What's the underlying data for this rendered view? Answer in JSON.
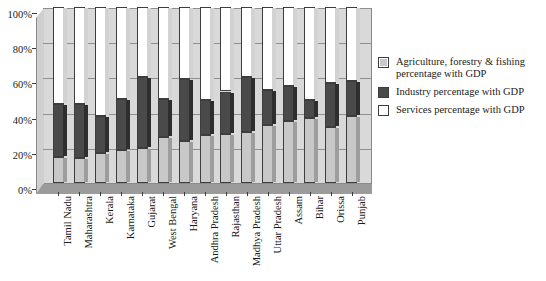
{
  "chart_data": {
    "type": "bar",
    "stacked": true,
    "orientation": "vertical",
    "title": "",
    "xlabel": "",
    "ylabel": "",
    "ylim": [
      0,
      100
    ],
    "yunit": "%",
    "grid": true,
    "legend_position": "right",
    "ytick_labels": [
      "100%",
      "80%",
      "60%",
      "40%",
      "20%",
      "0%"
    ],
    "ytick_values": [
      100,
      80,
      60,
      40,
      20,
      0
    ],
    "categories": [
      "Tamil Nadu",
      "Maharashtra",
      "Kerala",
      "Karnataka",
      "Gujarat",
      "West Bengal",
      "Haryana",
      "Andhra Pradesh",
      "Rajasthan",
      "Madhya Pradesh",
      "Uttar Pradesh",
      "Assam",
      "Bihar",
      "Orissa",
      "Punjab"
    ],
    "series": [
      {
        "name": "Agriculture, forestry & fishing percentage with GDP",
        "color": "#c8c8c8",
        "values": [
          15,
          14,
          17,
          19,
          20,
          26,
          24,
          27,
          28,
          29,
          33,
          35,
          37,
          32,
          38
        ]
      },
      {
        "name": "Industry percentage with GDP",
        "color": "#4a4a4a",
        "values": [
          30,
          31,
          21,
          29,
          40,
          22,
          35,
          20,
          24,
          31,
          20,
          20,
          10,
          25,
          20
        ]
      },
      {
        "name": "Services percentage with GDP",
        "color": "#ffffff",
        "values": [
          55,
          55,
          62,
          52,
          40,
          52,
          41,
          53,
          48,
          40,
          47,
          45,
          53,
          43,
          42
        ]
      }
    ]
  },
  "legend": {
    "items": [
      {
        "label": "Agriculture, forestry & fishing percentage with GDP",
        "color": "#c8c8c8"
      },
      {
        "label": "Industry percentage with GDP",
        "color": "#4a4a4a"
      },
      {
        "label": "Services percentage with GDP",
        "color": "#ffffff"
      }
    ]
  }
}
